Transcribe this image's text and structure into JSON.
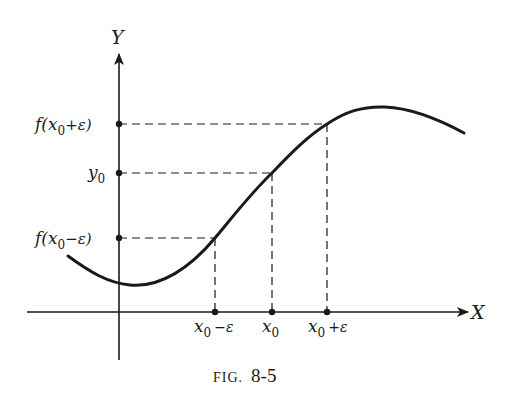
{
  "figure": {
    "caption_prefix": "FIG.",
    "caption_number": "8-5",
    "axes": {
      "x_label": "X",
      "y_label": "Y"
    },
    "y_ticks": [
      {
        "label_main": "f(x",
        "label_sub": "0",
        "label_tail": "+ε)",
        "id": "f-x0-plus-eps"
      },
      {
        "label_main": "y",
        "label_sub": "0",
        "label_tail": "",
        "id": "y0"
      },
      {
        "label_main": "f(x",
        "label_sub": "0",
        "label_tail": "−ε)",
        "id": "f-x0-minus-eps"
      }
    ],
    "x_ticks": [
      {
        "label_main": "x",
        "label_sub": "0",
        "label_tail": "−ε",
        "id": "x0-minus-eps"
      },
      {
        "label_main": "x",
        "label_sub": "0",
        "label_tail": "",
        "id": "x0"
      },
      {
        "label_main": "x",
        "label_sub": "0",
        "label_tail": "+ε",
        "id": "x0-plus-eps"
      }
    ],
    "colors": {
      "ink": "#1a1a1a",
      "background": "#ffffff"
    }
  }
}
